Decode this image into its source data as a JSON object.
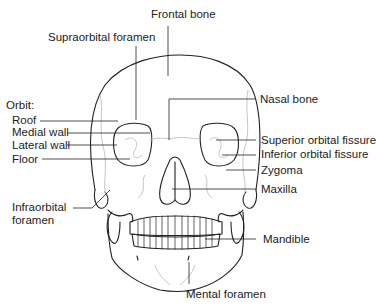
{
  "diagram": {
    "labels": {
      "frontal_bone": "Frontal bone",
      "supraorbital_foramen": "Supraorbital foramen",
      "orbit_heading": "Orbit:",
      "roof": "Roof",
      "medial_wall": "Medial wall",
      "lateral_wall": "Lateral wall",
      "floor": "Floor",
      "infraorbital_foramen_1": "Infraorbital",
      "infraorbital_foramen_2": "foramen",
      "nasal_bone": "Nasal bone",
      "superior_orbital_fissure": "Superior orbital fissure",
      "inferior_orbital_fissure": "Inferior orbital fissure",
      "zygoma": "Zygoma",
      "maxilla": "Maxilla",
      "mandible": "Mandible",
      "mental_foramen": "Mental foramen"
    },
    "colors": {
      "outline": "#222222",
      "suture": "#b8b8b8",
      "text": "#222222",
      "background": "#ffffff"
    }
  }
}
